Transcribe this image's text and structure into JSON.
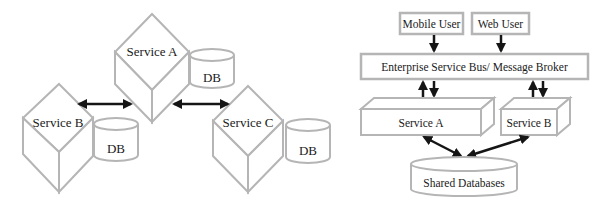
{
  "left_diagram": {
    "name": "Microservices",
    "services": [
      {
        "id": "service-a",
        "label": "Service A",
        "db_label": "DB"
      },
      {
        "id": "service-b",
        "label": "Service B",
        "db_label": "DB"
      },
      {
        "id": "service-c",
        "label": "Service C",
        "db_label": "DB"
      }
    ],
    "connections": [
      {
        "from": "Service B",
        "to": "Service A",
        "type": "bidirectional"
      },
      {
        "from": "Service A",
        "to": "Service C",
        "type": "bidirectional"
      }
    ]
  },
  "right_diagram": {
    "name": "SOA",
    "users": [
      {
        "id": "mobile-user",
        "label": "Mobile User"
      },
      {
        "id": "web-user",
        "label": "Web User"
      }
    ],
    "bus": {
      "label": "Enterprise Service Bus/ Message Broker"
    },
    "services": [
      {
        "id": "service-a",
        "label": "Service A"
      },
      {
        "id": "service-b",
        "label": "Service B"
      }
    ],
    "database": {
      "label": "Shared Databases"
    },
    "connections": [
      {
        "from": "Mobile User",
        "to": "Enterprise Service Bus/ Message Broker",
        "type": "directed"
      },
      {
        "from": "Web User",
        "to": "Enterprise Service Bus/ Message Broker",
        "type": "directed"
      },
      {
        "from": "Enterprise Service Bus/ Message Broker",
        "to": "Service A",
        "type": "two-way"
      },
      {
        "from": "Enterprise Service Bus/ Message Broker",
        "to": "Service B",
        "type": "two-way"
      },
      {
        "from": "Service A",
        "to": "Shared Databases",
        "type": "bidirectional"
      },
      {
        "from": "Service B",
        "to": "Shared Databases",
        "type": "bidirectional"
      }
    ]
  },
  "colors": {
    "shape_stroke": "#b5b5b5",
    "arrow": "#151515",
    "text": "#1a1a1a",
    "background": "#ffffff"
  }
}
